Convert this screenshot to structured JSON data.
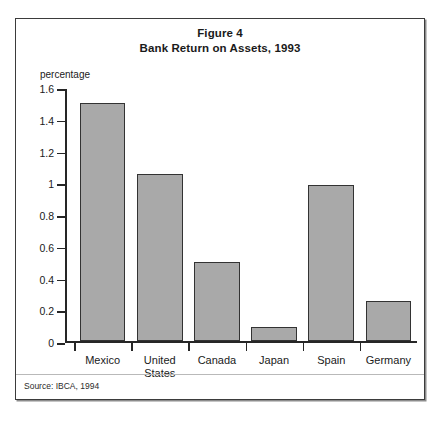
{
  "figure": {
    "title_line1": "Figure 4",
    "title_line2": "Bank Return on Assets, 1993",
    "unit_label": "percentage",
    "source_note": "Source: IBCA, 1994"
  },
  "colors": {
    "bar_fill": "#a9a9a9",
    "bar_border": "#333333",
    "axis": "#262626",
    "frame": "#3b3b3b"
  },
  "chart_data": {
    "type": "bar",
    "xlabel": "",
    "ylabel": "percentage",
    "ylim": [
      0,
      1.6
    ],
    "yticks": [
      0,
      0.2,
      0.4,
      0.6,
      0.8,
      1,
      1.2,
      1.4,
      1.6
    ],
    "ytick_labels": [
      "0",
      "0.2",
      "0.4",
      "0.6",
      "0.8",
      "1",
      "1.2",
      "1.4",
      "1.6"
    ],
    "grid": false,
    "legend": "none",
    "categories": [
      "Mexico",
      "United\nStates",
      "Canada",
      "Japan",
      "Spain",
      "Germany"
    ],
    "values": [
      1.5,
      1.05,
      0.5,
      0.09,
      0.98,
      0.25
    ]
  }
}
